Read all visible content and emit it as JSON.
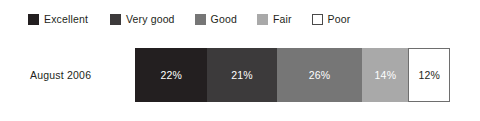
{
  "legend": {
    "items": [
      {
        "label": "Excellent",
        "color": "#231f20",
        "swatch_icon": "legend-swatch-icon",
        "gap_after": 22
      },
      {
        "label": "Very good",
        "color": "#3c3a3b",
        "swatch_icon": "legend-swatch-icon",
        "gap_after": 20
      },
      {
        "label": "Good",
        "color": "#767676",
        "swatch_icon": "legend-swatch-icon",
        "gap_after": 20
      },
      {
        "label": "Fair",
        "color": "#a9a9a9",
        "swatch_icon": "legend-swatch-icon",
        "gap_after": 20
      },
      {
        "label": "Poor",
        "color": "#ffffff",
        "swatch_icon": "legend-swatch-icon",
        "gap_after": 0
      }
    ]
  },
  "row": {
    "label": "August 2006"
  },
  "chart_data": {
    "type": "bar",
    "title": "",
    "subtitle": "",
    "xlabel": "",
    "ylabel": "",
    "orientation": "horizontal",
    "stacked": true,
    "grid": false,
    "legend_position": "top-left",
    "categories": [
      "August 2006"
    ],
    "xlim": [
      0,
      95
    ],
    "series": [
      {
        "name": "Excellent",
        "values": [
          22
        ],
        "label": "22%",
        "color": "#231f20",
        "text_color": "#ffffff"
      },
      {
        "name": "Very good",
        "values": [
          21
        ],
        "label": "21%",
        "color": "#3c3a3b",
        "text_color": "#ffffff"
      },
      {
        "name": "Good",
        "values": [
          26
        ],
        "label": "26%",
        "color": "#767676",
        "text_color": "#ffffff"
      },
      {
        "name": "Fair",
        "values": [
          14
        ],
        "label": "14%",
        "color": "#a9a9a9",
        "text_color": "#ffffff"
      },
      {
        "name": "Poor",
        "values": [
          12
        ],
        "label": "12%",
        "color": "#ffffff",
        "text_color": "#231f20"
      }
    ]
  }
}
